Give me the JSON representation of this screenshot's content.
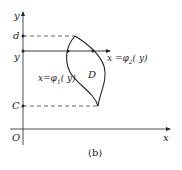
{
  "figure": {
    "caption": "(b)",
    "axes": {
      "x_label": "x",
      "y_label": "y",
      "origin_label": "O"
    },
    "y_ticks": {
      "d": "d",
      "y": "y",
      "c": "C"
    },
    "region_label": "D",
    "curves": {
      "left": "x=φ1(y)",
      "left_parts": {
        "prefix": "x=φ",
        "sub": "1",
        "suffix": "( y)"
      },
      "right": "x =φ2( y)",
      "right_parts": {
        "prefix": "x =φ",
        "sub": "2",
        "suffix": "( y)"
      }
    },
    "colors": {
      "ink": "#222222",
      "background": "#ffffff"
    }
  }
}
